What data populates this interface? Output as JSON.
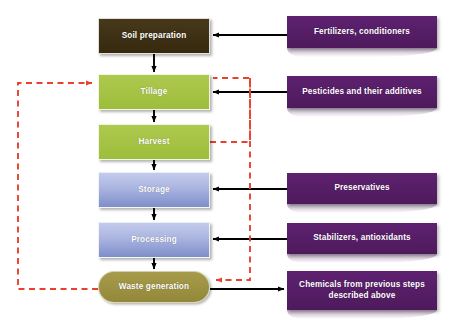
{
  "diagram": {
    "colors": {
      "soil": "#3d3014",
      "crop": "#a6c446",
      "processing": "#aab4e0",
      "waste": "#9a9040",
      "inputs": "#571e66",
      "flow_arrow": "#000000",
      "feedback_arrow": "#e8412f",
      "background": "#ffffff"
    },
    "process_nodes": [
      {
        "id": "soil_preparation",
        "label": "Soil preparation",
        "shape": "rectangle",
        "color": "#3d3014"
      },
      {
        "id": "tillage",
        "label": "Tillage",
        "shape": "rectangle",
        "color": "#a6c446"
      },
      {
        "id": "harvest",
        "label": "Harvest",
        "shape": "rectangle",
        "color": "#a6c446"
      },
      {
        "id": "storage",
        "label": "Storage",
        "shape": "rectangle",
        "color": "#aab4e0"
      },
      {
        "id": "processing",
        "label": "Processing",
        "shape": "rectangle",
        "color": "#aab4e0"
      },
      {
        "id": "waste_generation",
        "label": "Waste generation",
        "shape": "rounded-pill",
        "color": "#9a9040"
      }
    ],
    "input_nodes": [
      {
        "id": "fertilizers",
        "label": "Fertilizers, conditioners",
        "target": "soil_preparation",
        "color": "#571e66"
      },
      {
        "id": "pesticides",
        "label": "Pesticides and their additives",
        "target": "tillage",
        "color": "#571e66"
      },
      {
        "id": "preservatives",
        "label": "Preservatives",
        "target": "storage",
        "color": "#571e66"
      },
      {
        "id": "stabilizers",
        "label": "Stabilizers, antioxidants",
        "target": "processing",
        "color": "#571e66"
      },
      {
        "id": "chemicals_previous",
        "label_line1": "Chemicals from previous steps",
        "label_line2": "described above",
        "source": "waste_generation",
        "color": "#571e66"
      }
    ],
    "flow_edges": [
      {
        "from": "soil_preparation",
        "to": "tillage",
        "style": "solid-black"
      },
      {
        "from": "tillage",
        "to": "harvest",
        "style": "solid-black"
      },
      {
        "from": "harvest",
        "to": "storage",
        "style": "solid-black"
      },
      {
        "from": "storage",
        "to": "processing",
        "style": "solid-black"
      },
      {
        "from": "processing",
        "to": "waste_generation",
        "style": "solid-black"
      },
      {
        "from": "fertilizers",
        "to": "soil_preparation",
        "style": "solid-black"
      },
      {
        "from": "pesticides",
        "to": "tillage",
        "style": "solid-black"
      },
      {
        "from": "preservatives",
        "to": "storage",
        "style": "solid-black"
      },
      {
        "from": "stabilizers",
        "to": "processing",
        "style": "solid-black"
      },
      {
        "from": "waste_generation",
        "to": "chemicals_previous",
        "style": "solid-black"
      }
    ],
    "feedback_edges": [
      {
        "from": "waste_generation",
        "to": "tillage",
        "style": "dashed-red",
        "routing": "left-loop"
      },
      {
        "from": "harvest",
        "to": "tillage",
        "style": "dashed-red",
        "routing": "right-loop"
      },
      {
        "from": "tillage",
        "to": "waste_generation",
        "style": "dashed-red",
        "routing": "right-vertical"
      }
    ]
  }
}
